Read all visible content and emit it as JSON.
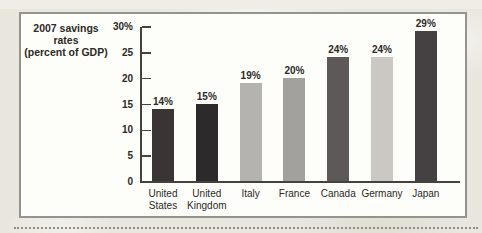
{
  "page": {
    "background_color": "#e9e6de",
    "panel_background": "#fdfdfa",
    "panel_border_color": "#95938e",
    "text_color": "#2c2a27"
  },
  "chart_data": {
    "type": "bar",
    "title": "2007 savings rates (percent of GDP)",
    "title_lines": [
      "2007 savings",
      "rates",
      "(percent of GDP)"
    ],
    "categories": [
      "United States",
      "United Kingdom",
      "Italy",
      "France",
      "Canada",
      "Germany",
      "Japan"
    ],
    "category_label_lines": [
      [
        "United",
        "States"
      ],
      [
        "United",
        "Kingdom"
      ],
      [
        "Italy"
      ],
      [
        "France"
      ],
      [
        "Canada"
      ],
      [
        "Germany"
      ],
      [
        "Japan"
      ]
    ],
    "values": [
      14,
      15,
      19,
      20,
      24,
      24,
      29
    ],
    "bar_labels": [
      "14%",
      "15%",
      "19%",
      "20%",
      "24%",
      "24%",
      "29%"
    ],
    "bar_colors": [
      "#3a3435",
      "#2d2a2b",
      "#b5b3b0",
      "#a3a19e",
      "#5e5958",
      "#cbc8c3",
      "#454041"
    ],
    "xlabel": "",
    "ylabel": "",
    "ylim": [
      0,
      30
    ],
    "yticks": [
      0,
      5,
      10,
      15,
      20,
      25,
      30
    ],
    "ytick_labels": [
      "0",
      "5",
      "10",
      "15",
      "20",
      "25",
      "30%"
    ],
    "grid": false,
    "legend": false
  }
}
